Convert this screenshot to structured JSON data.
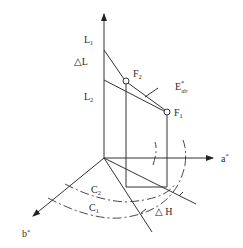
{
  "diagram": {
    "axes": {
      "L": {
        "label": "L"
      },
      "a": {
        "label": "a",
        "sup": "*"
      },
      "b": {
        "label": "b",
        "sup": "*"
      }
    },
    "points": {
      "F1": {
        "label": "F",
        "sub": "1"
      },
      "F2": {
        "label": "F",
        "sub": "2"
      }
    },
    "levels": {
      "L1": {
        "label": "L",
        "sub": "1"
      },
      "L2": {
        "label": "L",
        "sub": "2"
      }
    },
    "annotations": {
      "delta_L": "△L",
      "delta_H": "△ H",
      "E_ab": {
        "label": "E",
        "sup": "*",
        "sub": "ab"
      }
    },
    "arcs": {
      "C1": {
        "label": "C",
        "sub": "1"
      },
      "C2": {
        "label": "C",
        "sub": "2"
      }
    },
    "colors": {
      "stroke": "#333333",
      "background": "#ffffff"
    }
  }
}
